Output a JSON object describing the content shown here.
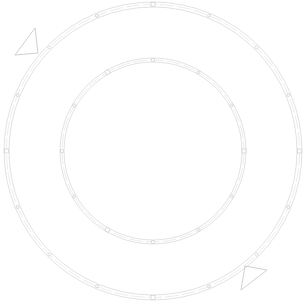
{
  "drawing": {
    "description": "Line drawing of two concentric rings with small rectangular markers, plus two triangle markers",
    "line_color": "#cfcfcf",
    "background": "#ffffff",
    "rings": [
      {
        "name": "outer-ring",
        "marker_count": 16
      },
      {
        "name": "inner-ring",
        "marker_count": 12
      }
    ],
    "triangles": [
      {
        "name": "triangle-top-left"
      },
      {
        "name": "triangle-bottom-right"
      }
    ]
  }
}
